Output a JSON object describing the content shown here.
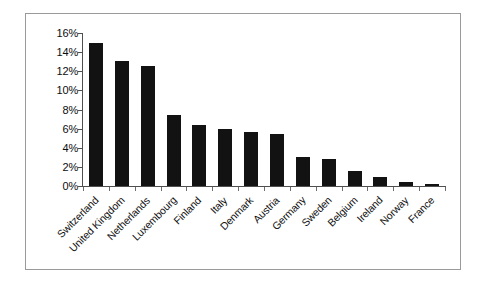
{
  "chart_data": {
    "type": "bar",
    "title": "",
    "subtitle": "",
    "xlabel": "",
    "ylabel": "",
    "categories": [
      "Switzerland",
      "United Kingdom",
      "Netherlands",
      "Luxembourg",
      "Finland",
      "Italy",
      "Denmark",
      "Austria",
      "Germany",
      "Sweden",
      "Belgium",
      "Ireland",
      "Norway",
      "France"
    ],
    "values": [
      15.0,
      13.1,
      12.6,
      7.4,
      6.4,
      6.0,
      5.7,
      5.4,
      3.0,
      2.8,
      1.6,
      0.9,
      0.45,
      0.2
    ],
    "value_labels": [
      "15%",
      "13.1%",
      "12.6%",
      "7.4%",
      "6.4%",
      "6%",
      "5.7%",
      "5.4%",
      "3%",
      "2.8%",
      "1.6%",
      "0.9%",
      "0.45%",
      "0.2%"
    ],
    "ylim": [
      0,
      16
    ],
    "ytick_values": [
      0,
      2,
      4,
      6,
      8,
      10,
      12,
      14,
      16
    ],
    "ytick_labels": [
      "0%",
      "2%",
      "4%",
      "6%",
      "8%",
      "10%",
      "12%",
      "14%",
      "16%"
    ],
    "grid": false,
    "legend": null,
    "legend_position": "none",
    "bar_color": "#121212",
    "axis_color": "#4f4f4f",
    "frame_color": "#9a9a9a",
    "background_color": "#ffffff",
    "x_tick_label_rotation": -45
  }
}
